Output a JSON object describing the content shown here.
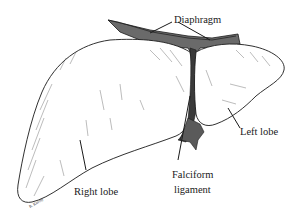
{
  "diagram": {
    "labels": {
      "diaphragm": "Diaphragm",
      "left_lobe": "Left lobe",
      "right_lobe": "Right lobe",
      "falciform_line1": "Falciform",
      "falciform_line2": "ligament"
    },
    "colors": {
      "ink": "#1a1a1a",
      "shade": "#4a4a4a",
      "background": "#ffffff"
    }
  }
}
